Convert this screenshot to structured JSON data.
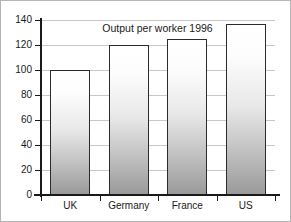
{
  "chart_data": {
    "type": "bar",
    "title": "Output per worker 1996",
    "xlabel": "",
    "ylabel": "",
    "categories": [
      "UK",
      "Germany",
      "France",
      "US"
    ],
    "values": [
      100,
      120,
      125,
      137
    ],
    "ylim": [
      0,
      140
    ],
    "yticks": [
      0,
      20,
      40,
      60,
      80,
      100,
      120,
      140
    ],
    "ytick_labels": [
      "0",
      "20",
      "40",
      "60",
      "80",
      "100",
      "120",
      "140"
    ],
    "grid": true,
    "legend": null,
    "colors": {
      "bar_outline": "#2b2b2b",
      "bar_fill_top": "#ffffff",
      "bar_fill_bottom": "#9a9a9a",
      "gridline": "#c8c8c8",
      "axis": "#1a1a1a",
      "background": "#ffffff",
      "frame": "#b4b4b4"
    }
  }
}
